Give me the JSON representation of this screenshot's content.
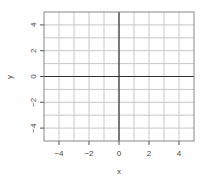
{
  "chart_data": {
    "type": "scatter",
    "title": "",
    "xlabel": "x",
    "ylabel": "y",
    "xlim": [
      -5,
      5
    ],
    "ylim": [
      -5,
      5
    ],
    "grid": true,
    "grid_step": 1,
    "x_ticks": [
      -4,
      -2,
      0,
      2,
      4
    ],
    "y_ticks": [
      -4,
      -2,
      0,
      2,
      4
    ],
    "x_tick_labels": [
      "−4",
      "−2",
      "0",
      "2",
      "4"
    ],
    "y_tick_labels": [
      "−4",
      "−2",
      "0",
      "2",
      "4"
    ],
    "axis_lines": {
      "x": 0,
      "y": 0
    },
    "series": []
  },
  "colors": {
    "grid": "#c8c8c8",
    "axis_line": "#333333",
    "box": "#888888",
    "text": "#444444"
  }
}
